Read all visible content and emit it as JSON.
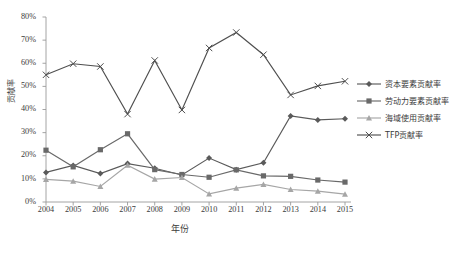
{
  "chart_data": {
    "type": "line",
    "title": "",
    "xlabel": "年份",
    "ylabel": "贡献率",
    "categories": [
      "2004",
      "2005",
      "2006",
      "2007",
      "2008",
      "2009",
      "2010",
      "2011",
      "2012",
      "2013",
      "2014",
      "2015"
    ],
    "ylim": [
      0,
      80
    ],
    "ytick_labels": [
      "0%",
      "10%",
      "20%",
      "30%",
      "40%",
      "50%",
      "60%",
      "70%",
      "80%"
    ],
    "ytick_values": [
      0,
      10,
      20,
      30,
      40,
      50,
      60,
      70,
      80
    ],
    "grid": false,
    "legend_position": "right",
    "series": [
      {
        "name": "资本要素贡献率",
        "color": "#5a5a5a",
        "marker": "diamond",
        "values": [
          12.8,
          15.8,
          12.3,
          16.6,
          14.6,
          11.7,
          19.0,
          14.0,
          17.0,
          37.2,
          35.5,
          36.0
        ]
      },
      {
        "name": "劳动力要素贡献率",
        "color": "#696969",
        "marker": "square",
        "values": [
          22.4,
          15.2,
          22.6,
          29.5,
          14.0,
          11.9,
          10.7,
          13.9,
          11.3,
          11.1,
          9.5,
          8.6
        ]
      },
      {
        "name": "海域使用贡献率",
        "color": "#a6a6a6",
        "marker": "triangle",
        "values": [
          9.8,
          9.0,
          6.7,
          15.9,
          9.9,
          10.6,
          3.5,
          6.0,
          7.6,
          5.4,
          4.7,
          3.4
        ]
      },
      {
        "name": "TFP贡献率",
        "color": "#4f4f4f",
        "marker": "cross",
        "values": [
          55.0,
          59.8,
          58.6,
          38.0,
          61.2,
          39.8,
          66.6,
          73.3,
          63.7,
          46.3,
          50.2,
          52.2
        ]
      }
    ]
  }
}
